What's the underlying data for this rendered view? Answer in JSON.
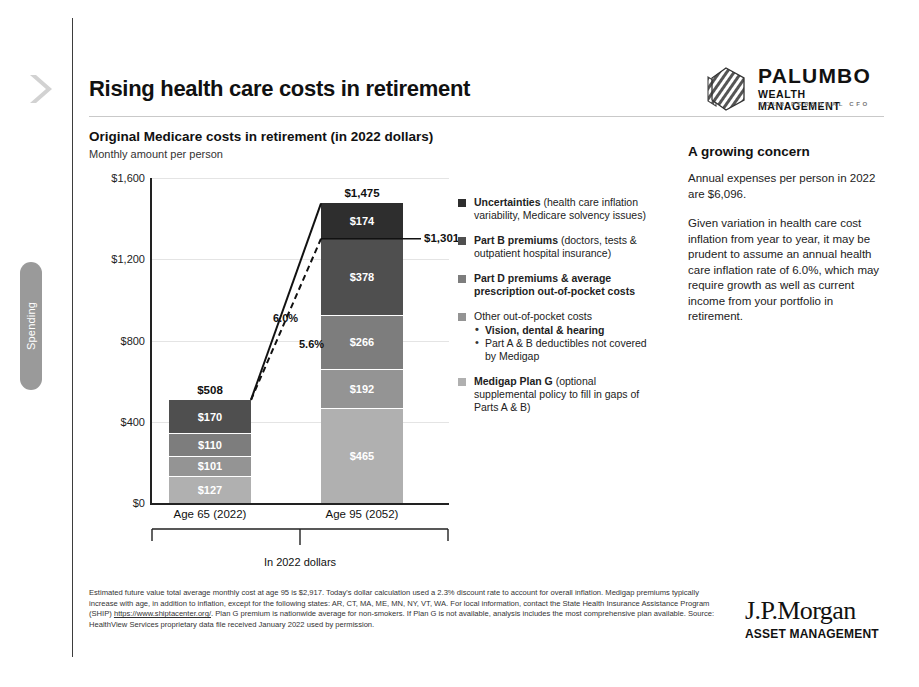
{
  "rail": {
    "chevron_icon": "chevron-right-icon",
    "spending_label": "Spending"
  },
  "header": {
    "title": "Rising health care costs in retirement",
    "logo": {
      "icon": "hexagon-stripes-icon",
      "name": "PALUMBO",
      "subtitle": "WEALTH MANAGEMENT",
      "tagline": "YOUR PERSONAL CFO"
    }
  },
  "chart_titles": {
    "title": "Original Medicare costs in retirement (in 2022 dollars)",
    "subtitle": "Monthly amount per person"
  },
  "chart_data": {
    "type": "bar",
    "stacked": true,
    "title": "Original Medicare costs in retirement (in 2022 dollars)",
    "subtitle": "Monthly amount per person",
    "xlabel": "",
    "ylabel": "",
    "ylim": [
      0,
      1600
    ],
    "yticks": [
      0,
      400,
      800,
      1200,
      1600
    ],
    "ytick_labels": [
      "$0",
      "$400",
      "$800",
      "$1,200",
      "$1,600"
    ],
    "grid": true,
    "categories": [
      "Age 65 (2022)",
      "Age 95 (2052)"
    ],
    "series": [
      {
        "name": "Medigap Plan G",
        "color": "#b0b0b0",
        "values": [
          127,
          465
        ],
        "labels": [
          "$127",
          "$465"
        ]
      },
      {
        "name": "Other out-of-pocket costs",
        "color": "#949494",
        "values": [
          101,
          192
        ],
        "labels": [
          "$101",
          "$192"
        ]
      },
      {
        "name": "Part D premiums & average prescription out-of-pocket costs",
        "color": "#7d7d7d",
        "values": [
          110,
          266
        ],
        "labels": [
          "$110",
          "$266"
        ]
      },
      {
        "name": "Part B premiums",
        "color": "#4f4f4f",
        "values": [
          170,
          378
        ],
        "labels": [
          "$170",
          "$378"
        ]
      },
      {
        "name": "Uncertainties",
        "color": "#2e2e2e",
        "values": [
          0,
          174
        ],
        "labels": [
          "",
          "$174"
        ]
      }
    ],
    "totals": [
      508,
      1475
    ],
    "total_labels": [
      "$508",
      "$1,475"
    ],
    "annotations": [
      {
        "text": "6.0%",
        "kind": "growth-rate-solid"
      },
      {
        "text": "5.6%",
        "kind": "growth-rate-dashed"
      },
      {
        "text": "$1,301",
        "kind": "callout-dashed-total"
      }
    ],
    "bracket_label": "In 2022 dollars"
  },
  "legend": {
    "items": [
      {
        "color": "#2e2e2e",
        "bold": "Uncertainties",
        "rest": " (health care inflation variability, Medicare solvency issues)",
        "sub": []
      },
      {
        "color": "#4f4f4f",
        "bold": "Part B premiums",
        "rest": " (doctors, tests & outpatient hospital insurance)",
        "sub": []
      },
      {
        "color": "#7d7d7d",
        "bold": "Part D premiums & average prescription out-of-pocket costs",
        "rest": "",
        "sub": []
      },
      {
        "color": "#949494",
        "bold": "",
        "rest": "Other out-of-pocket costs",
        "sub": [
          {
            "text": "Vision, dental & hearing",
            "bold": true
          },
          {
            "text": "Part A & B deductibles not covered by Medigap",
            "bold": false
          }
        ]
      },
      {
        "color": "#b0b0b0",
        "bold": "Medigap Plan G",
        "rest": " (optional supplemental policy to fill in gaps of Parts A & B)",
        "sub": []
      }
    ]
  },
  "panel": {
    "heading": "A growing concern",
    "para1": "Annual expenses per person in 2022 are $6,096.",
    "para2": "Given variation in health care cost inflation from year to year, it may be prudent to assume an annual health care inflation rate of 6.0%, which may require growth as well as current income from your portfolio in retirement."
  },
  "footnote": {
    "part1": "Estimated future value total average monthly cost at age 95 is $2,917. Today's dollar calculation used a 2.3% discount rate to account for overall inflation. Medigap premiums typically increase with age, in addition to inflation, except for the following states: AR, CT, MA, ME, MN, NY, VT, WA. For local information, contact the State Health Insurance Assistance Program (SHIP) ",
    "link": "https://www.shiptacenter.org/",
    "part2": ". Plan G premium is nationwide average for non-smokers. If Plan G is not available, analysis includes the most comprehensive plan available. Source: HealthView Services proprietary data file received January 2022 used by permission."
  },
  "brand": {
    "name": "J.P.Morgan",
    "subtitle": "ASSET MANAGEMENT"
  }
}
